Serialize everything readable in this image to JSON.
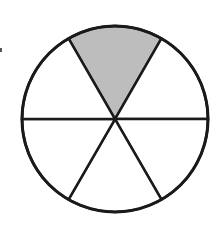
{
  "figure": {
    "sectors_total": 6,
    "sectors_shaded": 1,
    "fraction_shaded": "1/6",
    "center": [
      115,
      119
    ],
    "radius": 93,
    "shade_color": "#bdbdbd",
    "stroke_color": "#1a1a1a",
    "background": "#ffffff"
  }
}
